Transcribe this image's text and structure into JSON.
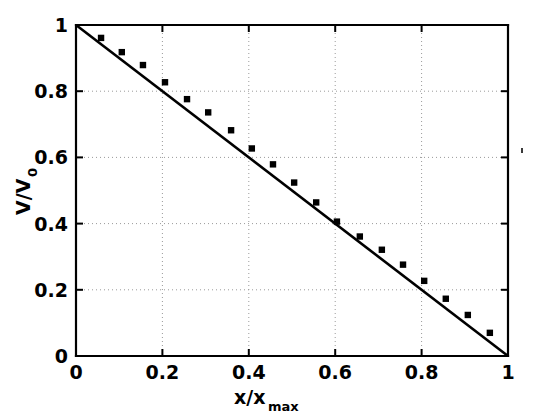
{
  "figure": {
    "background_color": "#ffffff",
    "foreground_color": "#000000",
    "grid_color": "#9a9a9a"
  },
  "axes": {
    "x_title_main": "x/x",
    "x_title_sub": "max",
    "y_title_main": "V/V",
    "y_title_sub": "0",
    "x_ticks": [
      "0",
      "0.2",
      "0.4",
      "0.6",
      "0.8",
      "1"
    ],
    "y_ticks": [
      "0",
      "0.2",
      "0.4",
      "0.6",
      "0.8",
      "1"
    ]
  },
  "chart_data": {
    "type": "scatter",
    "title": "",
    "xlabel": "x/x_max",
    "ylabel": "V/V_0",
    "xlim": [
      0,
      1
    ],
    "ylim": [
      0,
      1
    ],
    "xticks": [
      0,
      0.2,
      0.4,
      0.6,
      0.8,
      1
    ],
    "yticks": [
      0,
      0.2,
      0.4,
      0.6,
      0.8,
      1
    ],
    "grid": true,
    "legend": null,
    "series": [
      {
        "name": "measured",
        "marker": "square",
        "color": "#000000",
        "points": [
          [
            0.058,
            0.961
          ],
          [
            0.106,
            0.918
          ],
          [
            0.155,
            0.879
          ],
          [
            0.206,
            0.827
          ],
          [
            0.257,
            0.776
          ],
          [
            0.306,
            0.736
          ],
          [
            0.359,
            0.682
          ],
          [
            0.407,
            0.627
          ],
          [
            0.456,
            0.579
          ],
          [
            0.505,
            0.524
          ],
          [
            0.556,
            0.464
          ],
          [
            0.604,
            0.406
          ],
          [
            0.657,
            0.361
          ],
          [
            0.708,
            0.321
          ],
          [
            0.757,
            0.276
          ],
          [
            0.806,
            0.227
          ],
          [
            0.856,
            0.173
          ],
          [
            0.907,
            0.124
          ],
          [
            0.958,
            0.07
          ]
        ]
      },
      {
        "name": "linear-fit",
        "marker": "none",
        "color": "#000000",
        "line": true,
        "points": [
          [
            0.0,
            1.0
          ],
          [
            1.0,
            0.0
          ]
        ]
      }
    ]
  }
}
